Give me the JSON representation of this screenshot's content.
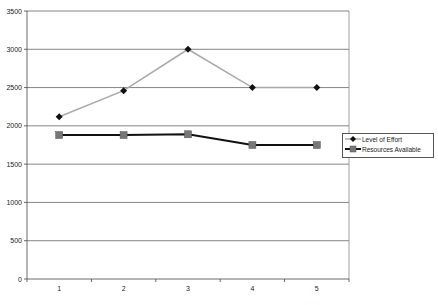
{
  "chart_data": {
    "type": "line",
    "title": "",
    "xlabel": "",
    "ylabel": "",
    "x": [
      "1",
      "2",
      "3",
      "4",
      "5"
    ],
    "ylim": [
      0,
      3500
    ],
    "yticks": [
      "0",
      "500",
      "1000",
      "1500",
      "2000",
      "2500",
      "3000",
      "3500"
    ],
    "grid": true,
    "legend_position": "right",
    "series": [
      {
        "name": "Level of Effort",
        "values": [
          2120,
          2460,
          3000,
          2500,
          2500
        ],
        "color": "#aaaaaa",
        "marker": "diamond",
        "marker_color": "#111111"
      },
      {
        "name": "Resources Available",
        "values": [
          1880,
          1880,
          1890,
          1750,
          1750
        ],
        "color": "#111111",
        "marker": "square",
        "marker_color": "#777777"
      }
    ]
  },
  "legend": {
    "items": [
      {
        "label": "Level of Effort"
      },
      {
        "label": "Resources Available"
      }
    ]
  }
}
